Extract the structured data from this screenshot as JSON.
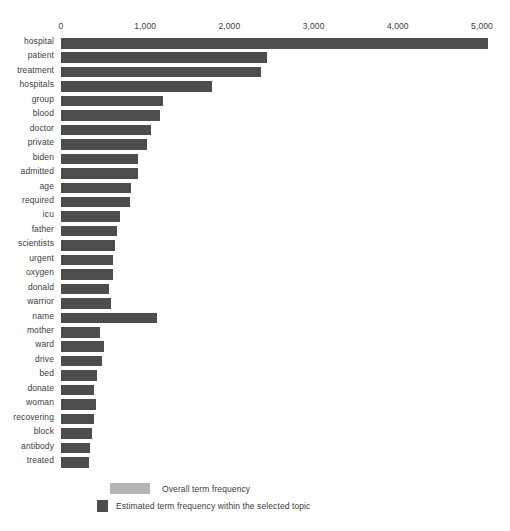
{
  "chart_data": {
    "type": "bar",
    "orientation": "horizontal",
    "title": "",
    "subtitle": "",
    "xlabel": "",
    "ylabel": "",
    "xlim": [
      0,
      5300
    ],
    "grid": false,
    "axis_position": "top",
    "tick_labels": [
      "0",
      "1,000",
      "2,000",
      "3,000",
      "4,000",
      "5,000"
    ],
    "tick_values": [
      0,
      1000,
      2000,
      3000,
      4000,
      5000
    ],
    "categories": [
      "hospital",
      "patient",
      "treatment",
      "hospitals",
      "group",
      "blood",
      "doctor",
      "private",
      "biden",
      "admitted",
      "age",
      "required",
      "icu",
      "father",
      "scientists",
      "urgent",
      "oxygen",
      "donald",
      "warrior",
      "name",
      "mother",
      "ward",
      "drive",
      "bed",
      "donate",
      "woman",
      "recovering",
      "block",
      "antibody",
      "treated"
    ],
    "series": [
      {
        "name": "Overall term frequency",
        "color": "#b5b5b5",
        "values": [
          5075,
          2450,
          2380,
          1790,
          1210,
          1180,
          1070,
          1020,
          920,
          915,
          830,
          820,
          700,
          665,
          640,
          620,
          615,
          570,
          590,
          1140,
          465,
          510,
          490,
          425,
          395,
          415,
          390,
          370,
          345,
          335
        ]
      },
      {
        "name": "Estimated term frequency within the selected topic",
        "color": "#4d4d4d",
        "values": [
          5075,
          2450,
          2380,
          1790,
          1210,
          1180,
          1070,
          1020,
          920,
          915,
          830,
          820,
          700,
          665,
          640,
          620,
          615,
          570,
          590,
          1140,
          465,
          510,
          490,
          425,
          395,
          415,
          390,
          370,
          345,
          335
        ]
      }
    ],
    "legend": {
      "position": "bottom",
      "entries": [
        {
          "label": "Overall term frequency",
          "color": "#b5b5b5"
        },
        {
          "label": "Estimated term frequency within the selected topic",
          "color": "#4d4d4d"
        }
      ]
    }
  }
}
